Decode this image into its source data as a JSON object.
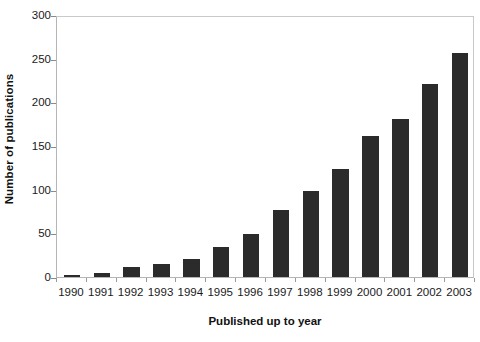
{
  "chart_data": {
    "type": "bar",
    "title": "",
    "subtitle": "",
    "xlabel": "Published up to year",
    "ylabel": "Number of publications",
    "categories": [
      "1990",
      "1991",
      "1992",
      "1993",
      "1994",
      "1995",
      "1996",
      "1997",
      "1998",
      "1999",
      "2000",
      "2001",
      "2002",
      "2003"
    ],
    "values": [
      2,
      5,
      11,
      15,
      21,
      34,
      49,
      77,
      98,
      124,
      161,
      181,
      221,
      256
    ],
    "series": [
      {
        "name": "Number of publications",
        "values": [
          2,
          5,
          11,
          15,
          21,
          34,
          49,
          77,
          98,
          124,
          161,
          181,
          221,
          256
        ]
      }
    ],
    "ylim": [
      0,
      300
    ],
    "yticks": [
      0,
      50,
      100,
      150,
      200,
      250,
      300
    ],
    "ytick_labels": [
      "0",
      "50",
      "100",
      "150",
      "200",
      "250",
      "300"
    ],
    "xtick_labels": [
      "1990",
      "1991",
      "1992",
      "1993",
      "1994",
      "1995",
      "1996",
      "1997",
      "1998",
      "1999",
      "2000",
      "2001",
      "2002",
      "2003"
    ],
    "grid": false,
    "legend": false,
    "legend_position": "none",
    "bar_color": "#2b2b2b",
    "plot_border_color": "#b5b5b5",
    "background_color": "#ffffff",
    "annotations": []
  },
  "axes": {
    "y_title": "Number of publications",
    "x_title": "Published up to year"
  }
}
